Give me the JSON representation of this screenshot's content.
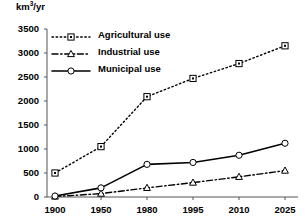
{
  "chart_data": {
    "type": "line",
    "title": "",
    "xlabel": "",
    "ylabel": "km3/yr",
    "ylabel_base": "km",
    "ylabel_sup": "3",
    "ylabel_tail": "/yr",
    "categories": [
      "1900",
      "1950",
      "1980",
      "1995",
      "2010",
      "2025"
    ],
    "ylim": [
      0,
      3500
    ],
    "yticks": [
      0,
      500,
      1000,
      1500,
      2000,
      2500,
      3000,
      3500
    ],
    "ytick_labels": [
      "0",
      "500",
      "1000",
      "1500",
      "2000",
      "2500",
      "3000",
      "3500"
    ],
    "grid": false,
    "legend_position": "upper-left",
    "series": [
      {
        "name": "Agricultural use",
        "values": [
          500,
          1050,
          2090,
          2470,
          2780,
          3150
        ],
        "marker": "square",
        "line_style": "dotted",
        "color": "#000000"
      },
      {
        "name": "Industrial use",
        "values": [
          10,
          70,
          190,
          300,
          420,
          550
        ],
        "marker": "triangle",
        "line_style": "dash-dot",
        "color": "#000000"
      },
      {
        "name": "Municipal use",
        "values": [
          20,
          190,
          680,
          720,
          870,
          1120
        ],
        "marker": "circle",
        "line_style": "solid",
        "color": "#000000"
      }
    ]
  }
}
